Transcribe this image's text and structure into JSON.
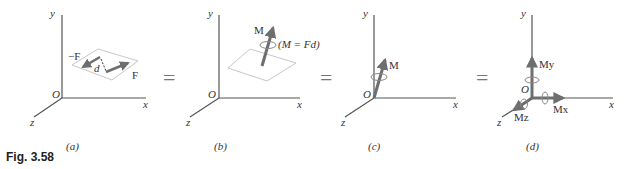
{
  "figure": {
    "caption": "Fig. 3.58",
    "equals": "=",
    "panels": [
      {
        "id": "a",
        "label": "(a)",
        "axes": {
          "x": "x",
          "y": "y",
          "z": "z",
          "origin": "O"
        },
        "forces": [
          "−F",
          "F"
        ],
        "distance": "d"
      },
      {
        "id": "b",
        "label": "(b)",
        "axes": {
          "x": "x",
          "y": "y",
          "z": "z",
          "origin": "O"
        },
        "moment": "M",
        "equation": "(M = Fd)"
      },
      {
        "id": "c",
        "label": "(c)",
        "axes": {
          "x": "x",
          "y": "y",
          "z": "z",
          "origin": "O"
        },
        "moment": "M"
      },
      {
        "id": "d",
        "label": "(d)",
        "axes": {
          "x": "x",
          "y": "y",
          "z": "z",
          "origin": "O"
        },
        "components": [
          "My",
          "Mx",
          "Mz"
        ]
      }
    ]
  },
  "colors": {
    "axis": "#555555",
    "arrow": "#6e6e6e",
    "plane": "#c8c8c8"
  }
}
